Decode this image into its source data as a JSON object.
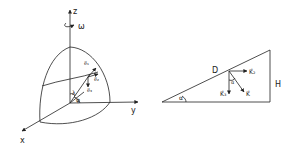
{
  "left_figure": {
    "axes": {
      "z": "z",
      "y": "y",
      "x": "x"
    },
    "rotation": "ω",
    "angles": {
      "lambda": "λ",
      "phi": "φ"
    },
    "vectors": [
      "e⃗₁",
      "e⃗₂",
      "e⃗₃"
    ]
  },
  "right_figure": {
    "labels": {
      "D": "D",
      "H": "H",
      "alpha_base": "α",
      "alpha_inner": "α"
    },
    "vectors": {
      "K2": "K⃗₂",
      "K3": "K⃗₃",
      "K": "K⃗"
    }
  },
  "colors": {
    "stroke": "#222222",
    "background": "#ffffff"
  }
}
